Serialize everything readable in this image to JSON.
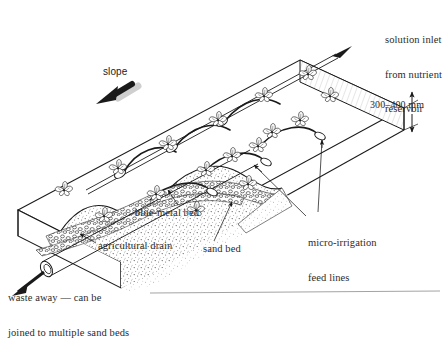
{
  "figure": {
    "type": "isometric-cutaway-illustration",
    "ink_color": "#1a1a1a",
    "background_color": "#ffffff"
  },
  "labels": {
    "slope": "slope",
    "solution_inlet": "solution inlet\nfrom nutrient\nreservoir",
    "solution_inlet_lines": [
      "solution inlet",
      "from nutrient",
      "reservoir"
    ],
    "dimension_depth": "300–400 mm",
    "micro_irrigation": "micro-irrigation\nfeed lines",
    "micro_irrigation_lines": [
      "micro-irrigation",
      "feed lines"
    ],
    "blue_metal_bed": "blue-metal bed",
    "agricultural_drain": "agricultural drain",
    "sand_bed": "sand bed",
    "waste_away": "waste away — can be\njoined to multiple sand beds",
    "waste_away_lines": [
      "waste away — can be",
      "joined to multiple sand beds"
    ]
  },
  "components": {
    "bed": "rectangular sand bed shown in isometric projection",
    "supply_pipe": "main micro-irrigation supply pipe along top edge",
    "feed_lines": "curved micro-irrigation feed lines with hook emitters",
    "plants": "plant rosettes growing in sand surface",
    "sand_layer": "stippled sand fill",
    "gravel_layer": "blue-metal (gravel) drainage bed",
    "drain_pipe": "agricultural drain pipe exiting lower left",
    "cutaway": "wavy torn cutaway revealing internal layers"
  },
  "counts": {
    "plants": 16,
    "feed_lines": 6,
    "emitters": 6
  }
}
